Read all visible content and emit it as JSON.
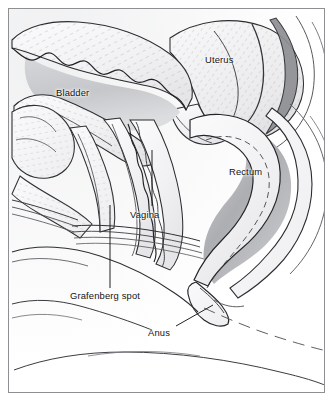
{
  "figure": {
    "type": "medical-anatomical-illustration",
    "style": "pen-and-ink line drawing with grey tonal shading",
    "frame": {
      "visible": true,
      "color": "#8d8f92",
      "inset_px": 8
    },
    "background_color": "#ffffff",
    "ink_color": "#1a1a1a",
    "shade_color": "#b9babd"
  },
  "labels": [
    {
      "id": "bladder",
      "text": "Bladder",
      "x": 56,
      "y": 88,
      "leader": false
    },
    {
      "id": "uterus",
      "text": "Uterus",
      "x": 205,
      "y": 55,
      "leader": false
    },
    {
      "id": "rectum",
      "text": "Rectum",
      "x": 229,
      "y": 167,
      "leader": false
    },
    {
      "id": "vagina",
      "text": "Vagina",
      "x": 130,
      "y": 210,
      "leader": true,
      "leader_from": [
        152,
        206
      ],
      "leader_to": [
        152,
        150
      ]
    },
    {
      "id": "grafenberg",
      "text": "Grafenberg spot",
      "x": 70,
      "y": 291,
      "leader": true,
      "leader_from": [
        110,
        288
      ],
      "leader_to": [
        110,
        205
      ]
    },
    {
      "id": "anus",
      "text": "Anus",
      "x": 148,
      "y": 328,
      "leader": true,
      "leader_from": [
        176,
        326
      ],
      "leader_to": [
        213,
        305
      ]
    }
  ],
  "structures": [
    {
      "id": "bladder",
      "name": "Bladder",
      "shading": "light-grey lumen, scalloped rugose wall with hatching"
    },
    {
      "id": "uterus",
      "name": "Uterus",
      "shading": "pale body with directional hatching, dark cervical outline"
    },
    {
      "id": "rectum",
      "name": "Rectum",
      "shading": "mid-grey gradient lumen"
    },
    {
      "id": "vagina",
      "name": "Vagina",
      "shading": "narrow corrugated canal"
    },
    {
      "id": "grafenberg_spot",
      "name": "Grafenberg spot",
      "shading": "anterior vaginal wall region"
    },
    {
      "id": "anus",
      "name": "Anus",
      "shading": "terminal sphincter"
    },
    {
      "id": "urethra",
      "name": "Urethra",
      "shading": "hatched tube below bladder"
    },
    {
      "id": "pubic_symphysis",
      "name": "Pubic symphysis",
      "shading": "hatched bone block, left"
    },
    {
      "id": "perineum",
      "name": "Perineum",
      "shading": "soft contour lines, lower field"
    }
  ]
}
